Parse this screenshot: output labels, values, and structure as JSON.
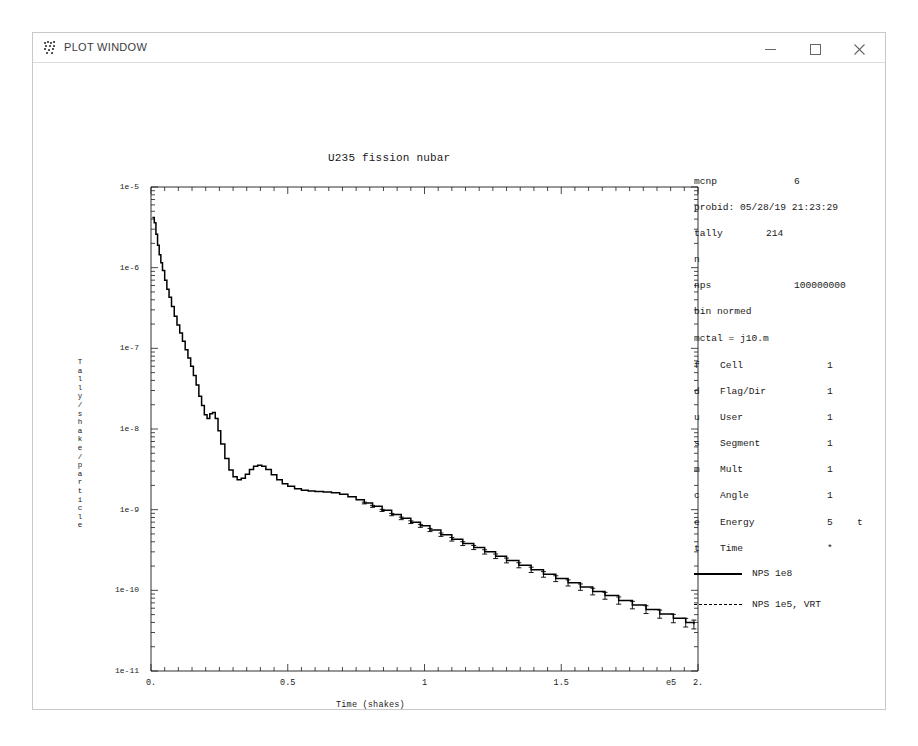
{
  "window": {
    "title": "PLOT WINDOW",
    "icon": "mcnp-plot-icon",
    "controls": {
      "minimize": "minimize-icon",
      "maximize": "maximize-icon",
      "close": "close-icon"
    }
  },
  "info": [
    {
      "key": "mcnp",
      "value": "6",
      "value_x": 100
    },
    {
      "key": "probid: 05/28/19 21:23:29",
      "value": "",
      "value_x": 0
    },
    {
      "key": "tally",
      "value": "214",
      "value_x": 72
    },
    {
      "key": "n",
      "value": "",
      "value_x": 0
    },
    {
      "key": "nps",
      "value": "100000000",
      "value_x": 100
    },
    {
      "key": "bin normed",
      "value": "",
      "value_x": 0
    },
    {
      "key": "mctal = j10.m",
      "value": "",
      "value_x": 0
    }
  ],
  "bin_table": [
    {
      "code": "f",
      "name": "Cell",
      "count": "1",
      "extra": ""
    },
    {
      "code": "d",
      "name": "Flag/Dir",
      "count": "1",
      "extra": ""
    },
    {
      "code": "u",
      "name": "User",
      "count": "1",
      "extra": ""
    },
    {
      "code": "s",
      "name": "Segment",
      "count": "1",
      "extra": ""
    },
    {
      "code": "m",
      "name": "Mult",
      "count": "1",
      "extra": ""
    },
    {
      "code": "c",
      "name": "Angle",
      "count": "1",
      "extra": ""
    },
    {
      "code": "e",
      "name": "Energy",
      "count": "5",
      "extra": "t"
    },
    {
      "code": "t",
      "name": "Time",
      "count": "*",
      "extra": ""
    }
  ],
  "legend": [
    {
      "label": "NPS 1e8",
      "style": "solid"
    },
    {
      "label": "NPS 1e5, VRT",
      "style": "dashed"
    }
  ],
  "chart_data": {
    "type": "line",
    "title": "U235 fission nubar",
    "xlabel": "Time (shakes)",
    "ylabel": "Tally/shake/particle",
    "x_multiplier": "e5",
    "xlim": [
      0,
      2
    ],
    "ylim": [
      1e-11,
      1e-05
    ],
    "yscale": "log",
    "xscale": "linear",
    "grid": false,
    "legend_position": "right",
    "xticks": [
      "0.",
      "0.5",
      "1",
      "1.5",
      "2."
    ],
    "xtick_values": [
      0,
      0.5,
      1,
      1.5,
      2
    ],
    "yticks": [
      "1e-5",
      "1e-6",
      "1e-7",
      "1e-8",
      "1e-9",
      "1e-10",
      "1e-11"
    ],
    "ytick_values": [
      1e-05,
      1e-06,
      1e-07,
      1e-08,
      1e-09,
      1e-10,
      1e-11
    ],
    "series": [
      {
        "name": "NPS 1e8",
        "style": "solid",
        "x": [
          0.005,
          0.012,
          0.018,
          0.024,
          0.03,
          0.036,
          0.042,
          0.05,
          0.058,
          0.066,
          0.075,
          0.085,
          0.095,
          0.105,
          0.115,
          0.125,
          0.135,
          0.145,
          0.155,
          0.165,
          0.175,
          0.185,
          0.195,
          0.205,
          0.215,
          0.225,
          0.235,
          0.245,
          0.255,
          0.27,
          0.285,
          0.3,
          0.315,
          0.33,
          0.345,
          0.36,
          0.375,
          0.39,
          0.405,
          0.42,
          0.44,
          0.46,
          0.48,
          0.5,
          0.525,
          0.55,
          0.575,
          0.6,
          0.63,
          0.66,
          0.69,
          0.72,
          0.75,
          0.78,
          0.81,
          0.845,
          0.88,
          0.915,
          0.95,
          0.985,
          1.02,
          1.06,
          1.1,
          1.14,
          1.18,
          1.22,
          1.26,
          1.3,
          1.345,
          1.39,
          1.435,
          1.48,
          1.525,
          1.57,
          1.615,
          1.66,
          1.71,
          1.76,
          1.81,
          1.86,
          1.91,
          1.955,
          1.985
        ],
        "y": [
          4.2e-06,
          3.6e-06,
          2.6e-06,
          1.9e-06,
          1.45e-06,
          1.15e-06,
          9.2e-07,
          7e-07,
          5.4e-07,
          4.3e-07,
          3.3e-07,
          2.5e-07,
          1.95e-07,
          1.55e-07,
          1.22e-07,
          9.6e-08,
          7.6e-08,
          6e-08,
          4.6e-08,
          3.5e-08,
          2.55e-08,
          1.95e-08,
          1.5e-08,
          1.35e-08,
          1.55e-08,
          1.6e-08,
          1.35e-08,
          9.5e-09,
          6.5e-09,
          4.3e-09,
          3.1e-09,
          2.55e-09,
          2.35e-09,
          2.45e-09,
          2.75e-09,
          3.15e-09,
          3.45e-09,
          3.55e-09,
          3.45e-09,
          3.15e-09,
          2.7e-09,
          2.35e-09,
          2.1e-09,
          1.95e-09,
          1.82e-09,
          1.74e-09,
          1.7e-09,
          1.68e-09,
          1.66e-09,
          1.62e-09,
          1.55e-09,
          1.45e-09,
          1.33e-09,
          1.21e-09,
          1.1e-09,
          9.8e-10,
          8.7e-10,
          7.8e-10,
          7e-10,
          6.3e-10,
          5.6e-10,
          4.9e-10,
          4.3e-10,
          3.8e-10,
          3.4e-10,
          3e-10,
          2.65e-10,
          2.35e-10,
          2.05e-10,
          1.8e-10,
          1.58e-10,
          1.4e-10,
          1.24e-10,
          1.1e-10,
          9.7e-11,
          8.6e-11,
          7.5e-11,
          6.6e-11,
          5.8e-11,
          5.1e-11,
          4.5e-11,
          4e-11,
          3.8e-11
        ]
      }
    ]
  }
}
